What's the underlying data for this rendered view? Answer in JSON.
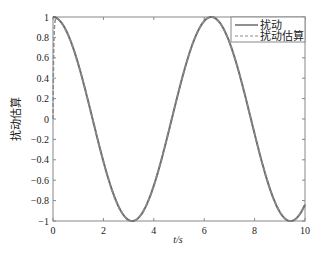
{
  "chart_data": {
    "type": "line",
    "title": "",
    "xlabel": "t/s",
    "ylabel": "扰动估算",
    "xlim": [
      0,
      10
    ],
    "ylim": [
      -1,
      1
    ],
    "xticks": [
      "0",
      "2",
      "4",
      "6",
      "8",
      "10"
    ],
    "yticks": [
      "1",
      "0.8",
      "0.6",
      "0.4",
      "0.2",
      "0",
      "-0.2",
      "-0.4",
      "-0.6",
      "-0.8",
      "-1"
    ],
    "grid": false,
    "legend_position": "upper right",
    "series": [
      {
        "name": "扰动",
        "style": "solid",
        "color": "#666666",
        "function": "cos(t)",
        "x": [
          0,
          1,
          2,
          3,
          3.14,
          4,
          5,
          6,
          6.28,
          7,
          8,
          9,
          9.42,
          10
        ],
        "values": [
          1,
          0.54,
          -0.42,
          -0.99,
          -1,
          -0.65,
          0.28,
          0.96,
          1,
          0.75,
          -0.15,
          -0.91,
          -1,
          -0.84
        ]
      },
      {
        "name": "扰动估算",
        "style": "dashed",
        "color": "#666666",
        "function": "cos(t) with initial transient from 0",
        "x": [
          0,
          0.05,
          0.1,
          1,
          2,
          3,
          3.14,
          4,
          5,
          6,
          6.28,
          7,
          8,
          9,
          9.42,
          10
        ],
        "values": [
          0,
          0.7,
          0.98,
          0.54,
          -0.42,
          -0.99,
          -1,
          -0.65,
          0.28,
          0.96,
          1,
          0.75,
          -0.15,
          -0.91,
          -1,
          -0.84
        ]
      }
    ]
  },
  "labels": {
    "xlabel": "t/s",
    "ylabel": "扰动估算",
    "legend": [
      "扰动",
      "扰动估算"
    ],
    "xticks": [
      "0",
      "2",
      "4",
      "6",
      "8",
      "10"
    ],
    "yticks": [
      "1",
      "0.8",
      "0.6",
      "0.4",
      "0.2",
      "0",
      "−0.2",
      "−0.4",
      "−0.6",
      "−0.8",
      "−1"
    ]
  }
}
